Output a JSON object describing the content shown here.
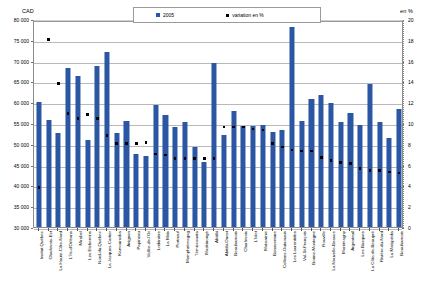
{
  "axes": {
    "left_unit": "CAD",
    "right_unit": "en %",
    "left_ticks": [
      "80 000",
      "75 000",
      "70 000",
      "65 000",
      "60 000",
      "55 000",
      "50 000",
      "45 000",
      "40 000",
      "35 000",
      "30 000"
    ],
    "right_ticks": [
      "20",
      "18",
      "16",
      "14",
      "12",
      "10",
      "8",
      "6",
      "4",
      "2",
      "0"
    ]
  },
  "legend": {
    "series_label": "2005",
    "variation_label": "variation en %",
    "series_color": "#2b56a4",
    "variation_color": "#000000"
  },
  "chart_data": {
    "type": "bar",
    "title": "",
    "xlabel": "",
    "ylabel": "CAD",
    "y2label": "en %",
    "ylim": [
      30000,
      80000
    ],
    "y2lim": [
      0,
      20
    ],
    "grid": true,
    "legend_position": "top-center",
    "categories": [
      "Insitut Québec",
      "Charlevoix-Est",
      "La Haute-Côte-Nord",
      "L'Île-d'Orléans",
      "Mirabel",
      "Les Etchemins",
      "Nord-du-Québec",
      "La Jacques-Cartier",
      "Kamouraska",
      "Avignon",
      "Papineau",
      "Vallée-de-l'Or",
      "Lotbinière",
      "La Mitis",
      "Portneuf",
      "Memphrémagog",
      "Témiscouata",
      "Maskinongé",
      "Abitibi",
      "Abitibi-Ouest",
      "Beauharnois",
      "Charlevoix",
      "L'Islet",
      "Matawinie",
      "Bonaventure",
      "Collines-Outaouais",
      "Les Laurentides",
      "Val-St-François",
      "Bonne-Montagne",
      "Rouville",
      "La Nouvelle-Beauce",
      "Montmagny",
      "Argenteuil",
      "Les Basques",
      "La Côte-de-Beaupré",
      "Rivière-du-Nord",
      "La Matapédia",
      "Beauharnois"
    ],
    "series": [
      {
        "name": "2005",
        "axis": "left",
        "type": "bar",
        "color": "#2b56a4",
        "values": [
          60000,
          55800,
          52500,
          68200,
          66200,
          51000,
          68600,
          72000,
          52500,
          55600,
          47500,
          47000,
          59300,
          56900,
          54000,
          55200,
          49200,
          45700,
          69500,
          52000,
          57800,
          54200,
          54300,
          54500,
          52800,
          53400,
          78000,
          55500,
          60800,
          61800,
          59800,
          55300,
          57500,
          54500,
          64400,
          55200,
          51500,
          58400
        ]
      },
      {
        "name": "variation en %",
        "axis": "right",
        "type": "scatter",
        "color": "#000000",
        "values": [
          4.0,
          18.2,
          14.0,
          11.1,
          10.6,
          11.0,
          10.6,
          9.0,
          8.2,
          8.2,
          8.2,
          8.3,
          7.2,
          7.1,
          6.8,
          6.8,
          6.8,
          6.8,
          6.8,
          9.8,
          9.8,
          9.8,
          9.6,
          9.5,
          8.2,
          7.9,
          7.6,
          7.5,
          7.5,
          6.9,
          6.6,
          6.4,
          6.3,
          5.8,
          5.6,
          5.6,
          5.5,
          5.4
        ]
      }
    ]
  }
}
